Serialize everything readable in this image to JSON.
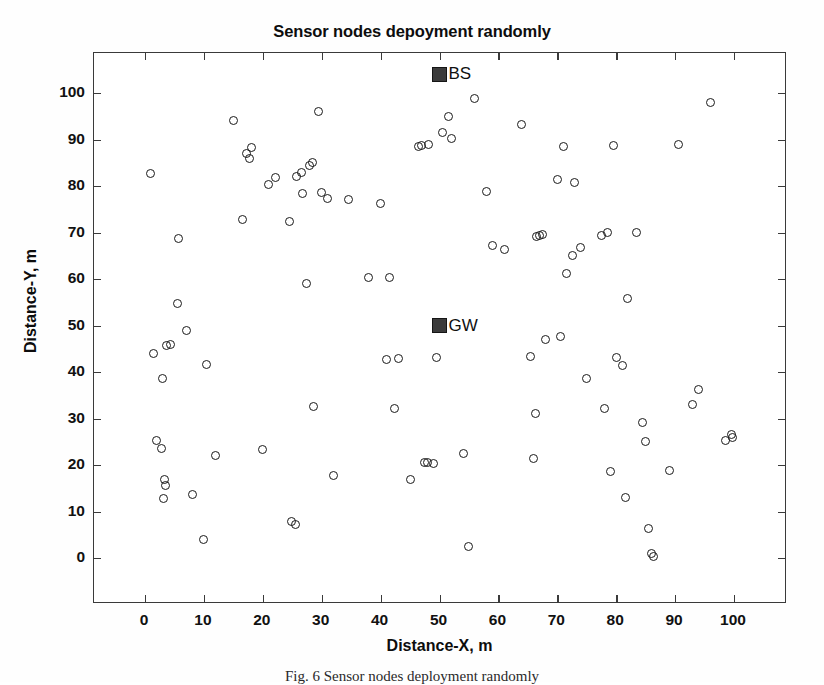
{
  "figure": {
    "title": "Sensor nodes depoyment randomly",
    "caption": "Fig. 6 Sensor nodes deployment randomly"
  },
  "axes": {
    "xlabel": "Distance-X, m",
    "ylabel": "Distance-Y, m",
    "xticks": [
      "0",
      "10",
      "20",
      "30",
      "40",
      "50",
      "60",
      "70",
      "80",
      "90",
      "100"
    ],
    "yticks": [
      "0",
      "10",
      "20",
      "30",
      "40",
      "50",
      "60",
      "70",
      "80",
      "90",
      "100"
    ],
    "xlim": [
      -9,
      109
    ],
    "ylim": [
      -10,
      110
    ],
    "grid": false
  },
  "stations": [
    {
      "name": "BS",
      "label": "BS",
      "x": 50,
      "y": 104,
      "color": "#3b3b3b"
    },
    {
      "name": "GW",
      "label": "GW",
      "x": 50,
      "y": 50,
      "color": "#3b3b3b"
    }
  ],
  "chart_data": {
    "type": "scatter",
    "title": "Sensor nodes depoyment randomly",
    "xlabel": "Distance-X, m",
    "ylabel": "Distance-Y, m",
    "xlim": [
      -9,
      109
    ],
    "ylim": [
      -10,
      110
    ],
    "grid": false,
    "legend": null,
    "marker": "open-circle",
    "series": [
      {
        "name": "Sensor nodes",
        "marker": "o",
        "points": [
          [
            1,
            82.7
          ],
          [
            1.5,
            43.9
          ],
          [
            2.0,
            25.3
          ],
          [
            2.8,
            23.5
          ],
          [
            3.0,
            38.7
          ],
          [
            3.3,
            16.8
          ],
          [
            3.5,
            15.5
          ],
          [
            3.2,
            12.7
          ],
          [
            3.6,
            45.6
          ],
          [
            4.4,
            46.0
          ],
          [
            5.5,
            54.8
          ],
          [
            5.7,
            68.8
          ],
          [
            7.0,
            48.9
          ],
          [
            8.0,
            13.6
          ],
          [
            10.0,
            3.9
          ],
          [
            10.5,
            41.6
          ],
          [
            12.0,
            22.0
          ],
          [
            15.0,
            94.1
          ],
          [
            16.5,
            72.8
          ],
          [
            17.3,
            87.0
          ],
          [
            17.8,
            86.0
          ],
          [
            18.0,
            88.2
          ],
          [
            20.0,
            23.4
          ],
          [
            21.0,
            80.4
          ],
          [
            22.2,
            81.8
          ],
          [
            24.5,
            72.3
          ],
          [
            24.8,
            7.8
          ],
          [
            25.5,
            7.3
          ],
          [
            25.8,
            82.1
          ],
          [
            26.5,
            83.0
          ],
          [
            26.8,
            78.3
          ],
          [
            27.5,
            59.0
          ],
          [
            28.0,
            84.4
          ],
          [
            28.5,
            85.0
          ],
          [
            28.6,
            32.6
          ],
          [
            29.5,
            96.0
          ],
          [
            30.0,
            78.7
          ],
          [
            31.0,
            77.3
          ],
          [
            32.0,
            17.7
          ],
          [
            34.5,
            77.1
          ],
          [
            38.0,
            60.3
          ],
          [
            40.0,
            76.2
          ],
          [
            41.0,
            42.7
          ],
          [
            41.5,
            60.4
          ],
          [
            42.3,
            32.1
          ],
          [
            43.0,
            42.9
          ],
          [
            45.0,
            16.8
          ],
          [
            46.5,
            88.5
          ],
          [
            47.0,
            88.8
          ],
          [
            47.5,
            20.5
          ],
          [
            48.0,
            20.6
          ],
          [
            48.2,
            88.9
          ],
          [
            49.0,
            20.3
          ],
          [
            49.5,
            43.2
          ],
          [
            50.5,
            91.5
          ],
          [
            51.5,
            95.0
          ],
          [
            52.0,
            90.2
          ],
          [
            54.0,
            22.5
          ],
          [
            55.0,
            2.5
          ],
          [
            56.0,
            98.9
          ],
          [
            58.0,
            78.9
          ],
          [
            59.0,
            67.1
          ],
          [
            61.0,
            66.3
          ],
          [
            64.0,
            93.2
          ],
          [
            65.5,
            43.3
          ],
          [
            66.0,
            21.3
          ],
          [
            66.3,
            31.0
          ],
          [
            66.5,
            69.2
          ],
          [
            67.0,
            69.4
          ],
          [
            67.5,
            69.6
          ],
          [
            68.0,
            46.9
          ],
          [
            70.0,
            81.5
          ],
          [
            70.5,
            47.7
          ],
          [
            71.0,
            88.5
          ],
          [
            71.5,
            61.2
          ],
          [
            72.5,
            65.0
          ],
          [
            73.0,
            80.8
          ],
          [
            74.0,
            66.8
          ],
          [
            75.0,
            38.6
          ],
          [
            77.5,
            69.3
          ],
          [
            78.0,
            32.1
          ],
          [
            78.5,
            70.0
          ],
          [
            79.0,
            18.7
          ],
          [
            79.5,
            88.8
          ],
          [
            80.0,
            43.1
          ],
          [
            81.0,
            41.3
          ],
          [
            81.5,
            13.0
          ],
          [
            82.0,
            55.7
          ],
          [
            83.5,
            70.0
          ],
          [
            84.5,
            29.2
          ],
          [
            85.0,
            25.0
          ],
          [
            85.5,
            6.4
          ],
          [
            86.0,
            0.9
          ],
          [
            86.3,
            0.4
          ],
          [
            89.0,
            18.9
          ],
          [
            90.5,
            88.9
          ],
          [
            93.0,
            33.0
          ],
          [
            94.0,
            36.2
          ],
          [
            96.0,
            98.0
          ],
          [
            98.5,
            25.2
          ],
          [
            99.5,
            26.6
          ],
          [
            99.8,
            26.0
          ]
        ]
      }
    ],
    "markers": [
      {
        "label": "BS",
        "x": 50,
        "y": 104,
        "marker": "filled-square"
      },
      {
        "label": "GW",
        "x": 50,
        "y": 50,
        "marker": "filled-square"
      }
    ]
  }
}
